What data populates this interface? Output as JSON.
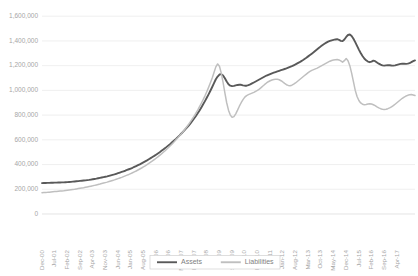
{
  "chart_data": {
    "type": "line",
    "title": "",
    "xlabel": "",
    "ylabel": "",
    "ylim": [
      0,
      1600000
    ],
    "ytick_values": [
      0,
      200000,
      400000,
      600000,
      800000,
      1000000,
      1200000,
      1400000,
      1600000
    ],
    "ytick_labels": [
      "0",
      "200,000",
      "400,000",
      "600,000",
      "800,000",
      "1,000,000",
      "1,200,000",
      "1,400,000",
      "1,600,000"
    ],
    "grid": true,
    "legend_position": "bottom-center",
    "x_label_interval_months": 7,
    "x_start": "Dec-00",
    "x_end": "Apr-17",
    "xtick_labels": [
      "Dec-00",
      "Jul-01",
      "Feb-02",
      "Sep-02",
      "Apr-03",
      "Nov-03",
      "Jun-04",
      "Jan-05",
      "Aug-05",
      "Mar-06",
      "Oct-06",
      "May-07",
      "Dec-07",
      "Jul-08",
      "Feb-09",
      "Sep-09",
      "Apr-10",
      "Nov-10",
      "Jun-11",
      "Jan-12",
      "Aug-12",
      "Mar-13",
      "Oct-13",
      "May-14",
      "Dec-14",
      "Jul-15",
      "Feb-16",
      "Sep-16",
      "Apr-17"
    ],
    "series": [
      {
        "name": "Assets",
        "color": "#595959",
        "values": [
          250000,
          250500,
          251000,
          251500,
          252000,
          252500,
          253000,
          253500,
          254000,
          254500,
          255000,
          255500,
          256000,
          257000,
          258000,
          259000,
          260000,
          261500,
          263000,
          264500,
          266000,
          267500,
          269000,
          270500,
          272000,
          274000,
          276000,
          278500,
          281000,
          283500,
          286000,
          289000,
          292000,
          295000,
          298000,
          301000,
          304000,
          308000,
          312000,
          316000,
          320000,
          325000,
          330000,
          335000,
          340000,
          345000,
          350000,
          356000,
          362000,
          368000,
          374000,
          381000,
          388000,
          395000,
          402000,
          410000,
          418000,
          426000,
          434000,
          443000,
          452000,
          461000,
          470000,
          480000,
          490000,
          500000,
          511000,
          522000,
          533000,
          545000,
          557000,
          569000,
          582000,
          595000,
          608000,
          622000,
          636000,
          651000,
          666000,
          682000,
          698000,
          715000,
          733000,
          752000,
          772000,
          793000,
          815000,
          838000,
          862000,
          887000,
          913000,
          940000,
          968000,
          997000,
          1027000,
          1058000,
          1090000,
          1112000,
          1128000,
          1131000,
          1120000,
          1098000,
          1072000,
          1050000,
          1038000,
          1034000,
          1036000,
          1040000,
          1044000,
          1046000,
          1045000,
          1041000,
          1038000,
          1038000,
          1042000,
          1048000,
          1056000,
          1064000,
          1072000,
          1080000,
          1088000,
          1096000,
          1104000,
          1112000,
          1120000,
          1126000,
          1132000,
          1138000,
          1143000,
          1148000,
          1153000,
          1158000,
          1163000,
          1168000,
          1173000,
          1178000,
          1184000,
          1190000,
          1196000,
          1203000,
          1210000,
          1218000,
          1226000,
          1235000,
          1244000,
          1254000,
          1264000,
          1275000,
          1286000,
          1297000,
          1308000,
          1320000,
          1332000,
          1344000,
          1356000,
          1367000,
          1377000,
          1386000,
          1394000,
          1400000,
          1405000,
          1409000,
          1412000,
          1414000,
          1409000,
          1400000,
          1398000,
          1412000,
          1432000,
          1448000,
          1452000,
          1440000,
          1418000,
          1390000,
          1360000,
          1330000,
          1302000,
          1278000,
          1258000,
          1243000,
          1233000,
          1228000,
          1232000,
          1240000,
          1236000,
          1226000,
          1216000,
          1208000,
          1202000,
          1200000,
          1202000,
          1204000,
          1203000,
          1201000,
          1200000,
          1202000,
          1206000,
          1210000,
          1214000,
          1216000,
          1215000,
          1214000,
          1216000,
          1221000,
          1228000,
          1236000,
          1242000
        ]
      },
      {
        "name": "Liabilities",
        "color": "#bfbfbf",
        "values": [
          172000,
          173000,
          174000,
          175000,
          176500,
          178000,
          179500,
          181000,
          182500,
          184000,
          185500,
          187000,
          188500,
          190500,
          192500,
          194500,
          196500,
          198500,
          200500,
          203000,
          205500,
          208000,
          210500,
          213000,
          216000,
          219000,
          222000,
          225000,
          228000,
          231500,
          235000,
          238500,
          242000,
          246000,
          250000,
          254000,
          258000,
          262500,
          267000,
          271500,
          276000,
          281000,
          286000,
          291000,
          296000,
          302000,
          308000,
          314000,
          320000,
          327000,
          334000,
          341000,
          348000,
          356000,
          364000,
          372000,
          381000,
          390000,
          399000,
          409000,
          419000,
          429000,
          440000,
          451000,
          462000,
          474000,
          486000,
          499000,
          512000,
          526000,
          540000,
          554000,
          569000,
          584000,
          600000,
          616000,
          633000,
          650000,
          668000,
          687000,
          706000,
          726000,
          747000,
          769000,
          792000,
          816000,
          841000,
          868000,
          896000,
          925000,
          956000,
          989000,
          1024000,
          1061000,
          1100000,
          1145000,
          1190000,
          1214000,
          1195000,
          1140000,
          1065000,
          980000,
          900000,
          840000,
          800000,
          782000,
          788000,
          810000,
          840000,
          872000,
          900000,
          925000,
          945000,
          958000,
          966000,
          972000,
          978000,
          984000,
          992000,
          1000000,
          1010000,
          1022000,
          1035000,
          1048000,
          1060000,
          1070000,
          1078000,
          1084000,
          1088000,
          1090000,
          1090000,
          1086000,
          1078000,
          1068000,
          1056000,
          1046000,
          1040000,
          1038000,
          1042000,
          1050000,
          1060000,
          1072000,
          1084000,
          1096000,
          1108000,
          1120000,
          1132000,
          1144000,
          1154000,
          1162000,
          1168000,
          1174000,
          1180000,
          1188000,
          1196000,
          1204000,
          1212000,
          1220000,
          1228000,
          1236000,
          1242000,
          1246000,
          1248000,
          1250000,
          1246000,
          1238000,
          1228000,
          1240000,
          1258000,
          1240000,
          1200000,
          1140000,
          1070000,
          1000000,
          950000,
          918000,
          898000,
          888000,
          884000,
          886000,
          890000,
          892000,
          890000,
          884000,
          876000,
          866000,
          858000,
          852000,
          848000,
          846000,
          848000,
          852000,
          858000,
          866000,
          876000,
          888000,
          900000,
          912000,
          924000,
          936000,
          946000,
          954000,
          960000,
          964000,
          966000,
          962000,
          958000
        ]
      }
    ],
    "legend": [
      {
        "label": "Assets",
        "color": "#595959"
      },
      {
        "label": "Liabilities",
        "color": "#bfbfbf"
      }
    ]
  }
}
